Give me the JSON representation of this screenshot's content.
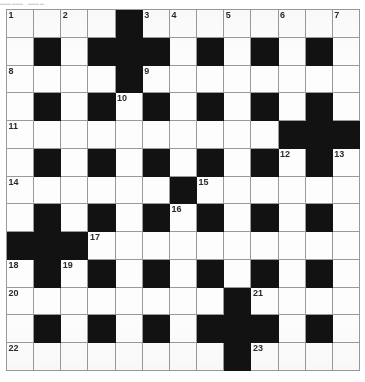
{
  "page": {
    "type": "crossword-puzzle-grid",
    "top_artifact_text": "▬▬ ▬▬"
  },
  "grid": {
    "columns": 13,
    "rows": 13,
    "cell_size_px": 27.2,
    "colors": {
      "block": "#121212",
      "open": "#fdfdfd",
      "line": "#9a9a9a",
      "number": "#2b2b2b"
    },
    "legend": {
      "0": "open cell",
      "1": "blocked cell"
    },
    "pattern": [
      [
        0,
        0,
        0,
        0,
        1,
        0,
        0,
        0,
        0,
        0,
        0,
        0,
        0
      ],
      [
        0,
        1,
        0,
        1,
        1,
        1,
        0,
        1,
        0,
        1,
        0,
        1,
        0
      ],
      [
        0,
        0,
        0,
        0,
        1,
        0,
        0,
        0,
        0,
        0,
        0,
        0,
        0
      ],
      [
        0,
        1,
        0,
        1,
        0,
        1,
        0,
        1,
        0,
        1,
        0,
        1,
        0
      ],
      [
        0,
        0,
        0,
        0,
        0,
        0,
        0,
        0,
        0,
        0,
        1,
        1,
        1
      ],
      [
        0,
        1,
        0,
        1,
        0,
        1,
        0,
        1,
        0,
        1,
        0,
        1,
        0
      ],
      [
        0,
        0,
        0,
        0,
        0,
        0,
        1,
        0,
        0,
        0,
        0,
        0,
        0
      ],
      [
        0,
        1,
        0,
        1,
        0,
        1,
        0,
        1,
        0,
        1,
        0,
        1,
        0
      ],
      [
        1,
        1,
        1,
        0,
        0,
        0,
        0,
        0,
        0,
        0,
        0,
        0,
        0
      ],
      [
        0,
        1,
        0,
        1,
        0,
        1,
        0,
        1,
        0,
        1,
        0,
        1,
        0
      ],
      [
        0,
        0,
        0,
        0,
        0,
        0,
        0,
        0,
        1,
        0,
        0,
        0,
        0
      ],
      [
        0,
        1,
        0,
        1,
        0,
        1,
        0,
        1,
        1,
        1,
        0,
        1,
        0
      ],
      [
        0,
        0,
        0,
        0,
        0,
        0,
        0,
        0,
        1,
        0,
        0,
        0,
        0
      ]
    ],
    "numbers": [
      {
        "row": 0,
        "col": 0,
        "label": "1"
      },
      {
        "row": 0,
        "col": 2,
        "label": "2"
      },
      {
        "row": 0,
        "col": 5,
        "label": "3"
      },
      {
        "row": 0,
        "col": 6,
        "label": "4"
      },
      {
        "row": 0,
        "col": 8,
        "label": "5"
      },
      {
        "row": 0,
        "col": 10,
        "label": "6"
      },
      {
        "row": 0,
        "col": 12,
        "label": "7"
      },
      {
        "row": 2,
        "col": 0,
        "label": "8"
      },
      {
        "row": 2,
        "col": 5,
        "label": "9"
      },
      {
        "row": 3,
        "col": 4,
        "label": "10"
      },
      {
        "row": 4,
        "col": 0,
        "label": "11"
      },
      {
        "row": 5,
        "col": 10,
        "label": "12"
      },
      {
        "row": 5,
        "col": 12,
        "label": "13"
      },
      {
        "row": 6,
        "col": 0,
        "label": "14"
      },
      {
        "row": 6,
        "col": 7,
        "label": "15"
      },
      {
        "row": 7,
        "col": 6,
        "label": "16"
      },
      {
        "row": 8,
        "col": 3,
        "label": "17"
      },
      {
        "row": 9,
        "col": 0,
        "label": "18"
      },
      {
        "row": 9,
        "col": 2,
        "label": "19"
      },
      {
        "row": 10,
        "col": 0,
        "label": "20"
      },
      {
        "row": 10,
        "col": 9,
        "label": "21"
      },
      {
        "row": 12,
        "col": 0,
        "label": "22"
      },
      {
        "row": 12,
        "col": 9,
        "label": "23"
      }
    ]
  }
}
